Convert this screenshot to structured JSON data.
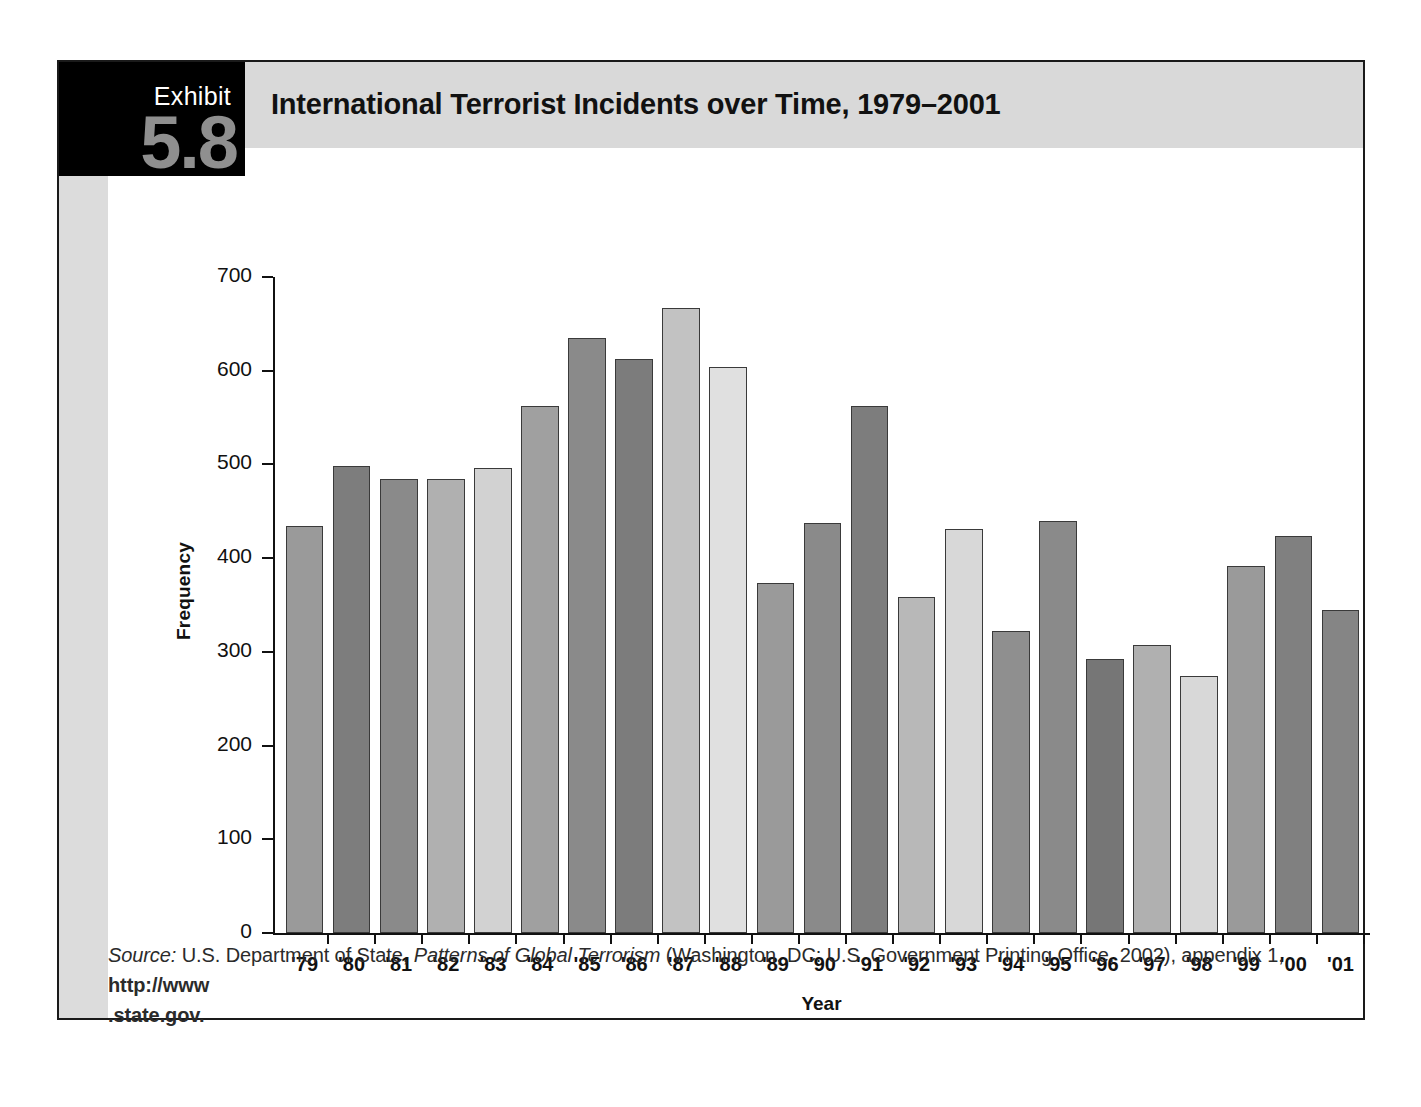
{
  "exhibit": {
    "label": "Exhibit",
    "number": "5.8",
    "title": "International Terrorist Incidents over Time, 1979–2001"
  },
  "source_note": {
    "prefix": "Source:",
    "publisher": "U.S. Department of State,",
    "work": "Patterns of Global Terrorism",
    "publication": "(Washington, DC: U.S. Government Printing Office, 2002), appendix 1,",
    "url_part1": "http://www",
    "url_part2": ".state.gov."
  },
  "chart_data": {
    "type": "bar",
    "title": "International Terrorist Incidents over Time, 1979–2001",
    "xlabel": "Year",
    "ylabel": "Frequency",
    "ylim": [
      0,
      700
    ],
    "ytick_step": 100,
    "yticks": [
      0,
      100,
      200,
      300,
      400,
      500,
      600,
      700
    ],
    "ytick_labels": [
      "0",
      "100",
      "200",
      "300",
      "400",
      "500",
      "600",
      "700"
    ],
    "grid": false,
    "legend": "none",
    "categories": [
      "'79",
      "'80",
      "'81",
      "'82",
      "'83",
      "'84",
      "'85",
      "'86",
      "'87",
      "'88",
      "'89",
      "'90",
      "'91",
      "'92",
      "'93",
      "'94",
      "'95",
      "'96",
      "'97",
      "'98",
      "'99",
      "'00",
      "'01"
    ],
    "values": [
      434,
      498,
      485,
      485,
      496,
      562,
      635,
      612,
      667,
      604,
      374,
      438,
      562,
      359,
      431,
      322,
      440,
      292,
      307,
      274,
      392,
      424,
      345
    ],
    "bar_colors": [
      "#9a9a9a",
      "#7d7d7d",
      "#8a8a8a",
      "#b0b0b0",
      "#d2d2d2",
      "#a0a0a0",
      "#8a8a8a",
      "#7c7c7c",
      "#c2c2c2",
      "#e0e0e0",
      "#9a9a9a",
      "#8a8a8a",
      "#7d7d7d",
      "#b8b8b8",
      "#d8d8d8",
      "#8f8f8f",
      "#8a8a8a",
      "#767676",
      "#b0b0b0",
      "#d8d8d8",
      "#9a9a9a",
      "#808080",
      "#858585"
    ],
    "bar_border_color": "#3a3a3a",
    "axis_color": "#111111"
  }
}
